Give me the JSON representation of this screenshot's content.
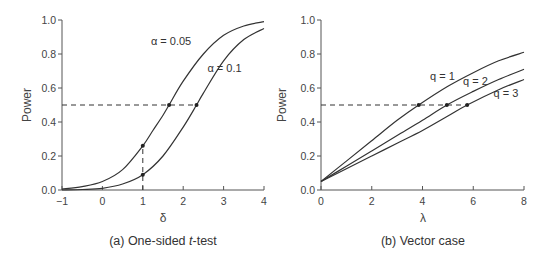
{
  "chart_data": [
    {
      "type": "line",
      "panel": "a",
      "caption_prefix": "(a) One-sided ",
      "caption_italic": "t",
      "caption_suffix": "-test",
      "xlabel": "δ",
      "ylabel": "Power",
      "xlim": [
        -1,
        4
      ],
      "ylim": [
        0,
        1
      ],
      "xticks": [
        -1,
        0,
        1,
        2,
        3,
        4
      ],
      "xtick_labels": [
        "−1",
        "0",
        "1",
        "2",
        "3",
        "4"
      ],
      "yticks": [
        0,
        0.2,
        0.4,
        0.6,
        0.8,
        1.0
      ],
      "ytick_labels": [
        "0.0",
        "0.2",
        "0.4",
        "0.6",
        "0.8",
        "1.0"
      ],
      "grid": false,
      "series": [
        {
          "name": "α = 0.05",
          "label_pos": [
            1.2,
            0.855
          ],
          "x": [
            -1,
            -0.5,
            0,
            0.5,
            1,
            1.25,
            1.5,
            1.65,
            2,
            2.5,
            3,
            3.5,
            4
          ],
          "values": [
            0.005,
            0.02,
            0.05,
            0.12,
            0.26,
            0.35,
            0.44,
            0.5,
            0.64,
            0.8,
            0.91,
            0.965,
            0.99
          ]
        },
        {
          "name": "α = 0.1",
          "label_pos": [
            2.6,
            0.695
          ],
          "x": [
            -1,
            -0.5,
            0,
            0.5,
            1,
            1.5,
            2,
            2.33,
            2.5,
            3,
            3.5,
            4
          ],
          "values": [
            0.0,
            0.003,
            0.01,
            0.035,
            0.09,
            0.2,
            0.37,
            0.5,
            0.57,
            0.76,
            0.885,
            0.95
          ]
        }
      ],
      "reference_line": {
        "y": 0.5,
        "x_from": -1,
        "x_to": 2.33
      },
      "vertical_reference": {
        "x": 1,
        "y_from": 0,
        "y_to": 0.26
      },
      "markers": [
        {
          "x": 1.65,
          "y": 0.5
        },
        {
          "x": 2.33,
          "y": 0.5
        },
        {
          "x": 1,
          "y": 0.26
        },
        {
          "x": 1,
          "y": 0.09
        }
      ]
    },
    {
      "type": "line",
      "panel": "b",
      "caption": "(b) Vector case",
      "xlabel": "λ",
      "ylabel": "Power",
      "xlim": [
        0,
        8
      ],
      "ylim": [
        0,
        1
      ],
      "xticks": [
        0,
        2,
        4,
        6,
        8
      ],
      "xtick_labels": [
        "0",
        "2",
        "4",
        "6",
        "8"
      ],
      "yticks": [
        0,
        0.2,
        0.4,
        0.6,
        0.8,
        1.0
      ],
      "ytick_labels": [
        "0.0",
        "0.2",
        "0.4",
        "0.6",
        "0.8",
        "1.0"
      ],
      "grid": false,
      "series": [
        {
          "name": "q = 1",
          "label_pos": [
            4.3,
            0.645
          ],
          "x": [
            0,
            1,
            2,
            3,
            3.85,
            5,
            6,
            7,
            8
          ],
          "values": [
            0.05,
            0.17,
            0.29,
            0.41,
            0.5,
            0.61,
            0.69,
            0.76,
            0.81
          ]
        },
        {
          "name": "q = 2",
          "label_pos": [
            5.6,
            0.62
          ],
          "x": [
            0,
            1,
            2,
            3,
            4,
            4.96,
            6,
            7,
            8
          ],
          "values": [
            0.05,
            0.14,
            0.23,
            0.32,
            0.41,
            0.5,
            0.58,
            0.65,
            0.71
          ]
        },
        {
          "name": "q = 3",
          "label_pos": [
            6.8,
            0.545
          ],
          "x": [
            0,
            1,
            2,
            3,
            4,
            5,
            5.76,
            7,
            8
          ],
          "values": [
            0.05,
            0.125,
            0.2,
            0.275,
            0.35,
            0.435,
            0.5,
            0.59,
            0.65
          ]
        }
      ],
      "reference_line": {
        "y": 0.5,
        "x_from": 0,
        "x_to": 5.76
      },
      "markers": [
        {
          "x": 3.85,
          "y": 0.5
        },
        {
          "x": 4.96,
          "y": 0.5
        },
        {
          "x": 5.76,
          "y": 0.5
        }
      ]
    }
  ]
}
